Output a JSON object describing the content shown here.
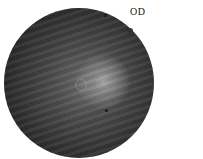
{
  "image": {
    "type": "fundus-photograph",
    "label": "OD",
    "colors": {
      "background": "#ffffff",
      "fundus_dark": "#141414",
      "fundus_mid": "#4e4e4e",
      "macula_bright": "#a9a9a9",
      "label_text": "#111111"
    }
  }
}
